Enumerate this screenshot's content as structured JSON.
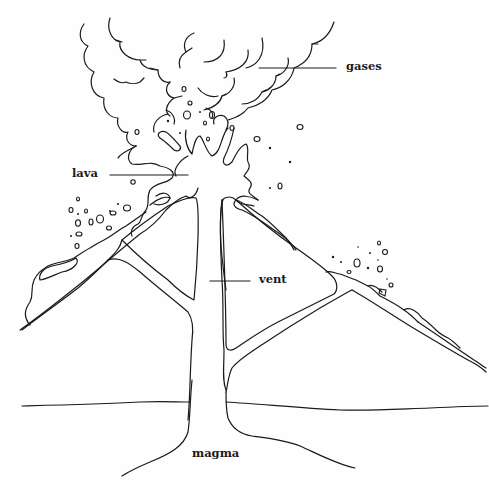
{
  "diagram": {
    "type": "labeled-illustration",
    "labels": {
      "gases": "gases",
      "lava": "lava",
      "vent": "vent",
      "magma": "magma"
    },
    "colors": {
      "line": "#1a1a1a",
      "background": "#fefefe"
    }
  }
}
